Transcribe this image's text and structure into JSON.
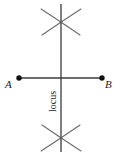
{
  "figure": {
    "kind": "perpendicular-bisector-construction",
    "stroke_color": "#555555",
    "dark_stroke_color": "#3a3a3a",
    "point_color": "#111111",
    "background": "#ffffff",
    "width": 119,
    "height": 155,
    "labels": {
      "point_a": "A",
      "point_b": "B",
      "locus": "locus"
    },
    "geometry": {
      "segment_ab": {
        "x1": 19,
        "y1": 78,
        "x2": 102,
        "y2": 78
      },
      "locus_line": {
        "x1": 61,
        "y1": 4,
        "x2": 61,
        "y2": 152
      },
      "point_a_marker": {
        "cx": 19,
        "cy": 78,
        "r": 2.6
      },
      "point_b_marker": {
        "cx": 102,
        "cy": 78,
        "r": 2.6
      },
      "top_arc_crossing": {
        "x": 61,
        "y": 21
      },
      "bottom_arc_crossing": {
        "x": 61,
        "y": 139
      },
      "arcs": [
        {
          "name": "top-left-arc",
          "d": "M 41 9  Q 58 20 80 35"
        },
        {
          "name": "top-right-arc",
          "d": "M 81 9  Q 64 20 42 35"
        },
        {
          "name": "bottom-left-arc",
          "d": "M 41 151 Q 58 140 80 125"
        },
        {
          "name": "bottom-right-arc",
          "d": "M 81 151 Q 64 140 42 125"
        }
      ]
    }
  }
}
